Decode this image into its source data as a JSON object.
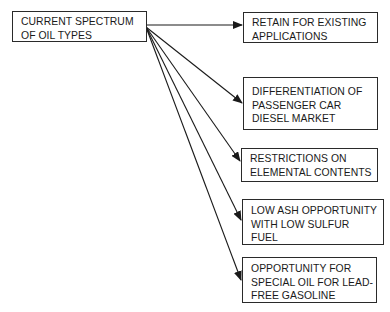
{
  "diagram": {
    "source": {
      "lines": [
        "CURRENT SPECTRUM",
        "OF OIL TYPES"
      ]
    },
    "targets": [
      {
        "lines": [
          "RETAIN FOR EXISTING",
          "APPLICATIONS"
        ]
      },
      {
        "lines": [
          "DIFFERENTIATION OF",
          "PASSENGER CAR",
          "DIESEL MARKET"
        ]
      },
      {
        "lines": [
          "RESTRICTIONS ON",
          "ELEMENTAL CONTENTS"
        ]
      },
      {
        "lines": [
          "LOW ASH OPPORTUNITY",
          "WITH LOW SULFUR",
          "FUEL"
        ]
      },
      {
        "lines": [
          "OPPORTUNITY FOR",
          "SPECIAL OIL FOR LEAD-",
          "FREE GASOLINE"
        ]
      }
    ],
    "colors": {
      "stroke": "#1a1a1a",
      "background": "#ffffff"
    }
  }
}
